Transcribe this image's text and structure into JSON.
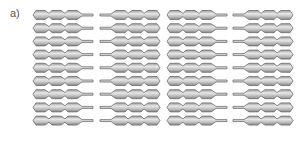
{
  "figure": {
    "panel_label": "a)",
    "rows": 9,
    "columns": [
      {
        "x": 33,
        "orientation": "beads-left-tail-right"
      },
      {
        "x": 100,
        "orientation": "tail-left-beads-right"
      },
      {
        "x": 167,
        "orientation": "beads-left-tail-right"
      },
      {
        "x": 233,
        "orientation": "tail-left-beads-right"
      }
    ],
    "row_start_y": 15,
    "row_spacing": 13.2,
    "chain": {
      "beads": 3,
      "bead_width": 16,
      "bead_height": 9,
      "tail_length": 12
    },
    "colors": {
      "bead_fill_light": "#e6e6e6",
      "bead_fill_dark": "#8f8f8f",
      "bead_stroke": "#6e6e6e",
      "label": "#555555",
      "background": "#ffffff"
    }
  }
}
